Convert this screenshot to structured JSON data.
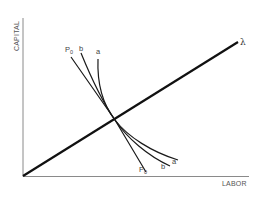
{
  "diagram": {
    "title": "",
    "axes": {
      "y_label": "CAPITAL",
      "x_label": "LABOR"
    },
    "ray": {
      "label": "λ",
      "description": "ray from origin (constant capital-labor ratio)"
    },
    "curves": [
      {
        "id": "P0",
        "label_main": "P",
        "label_sub": "0",
        "description": "isoquant P0"
      },
      {
        "id": "b",
        "label_main": "b",
        "label_sub": ""
      },
      {
        "id": "a",
        "label_main": "a",
        "label_sub": ""
      }
    ],
    "colors": {
      "axis": "#8a8a8a",
      "ray": "#111111",
      "curve": "#1a1a1a",
      "text": "#555555",
      "background": "#ffffff"
    }
  }
}
